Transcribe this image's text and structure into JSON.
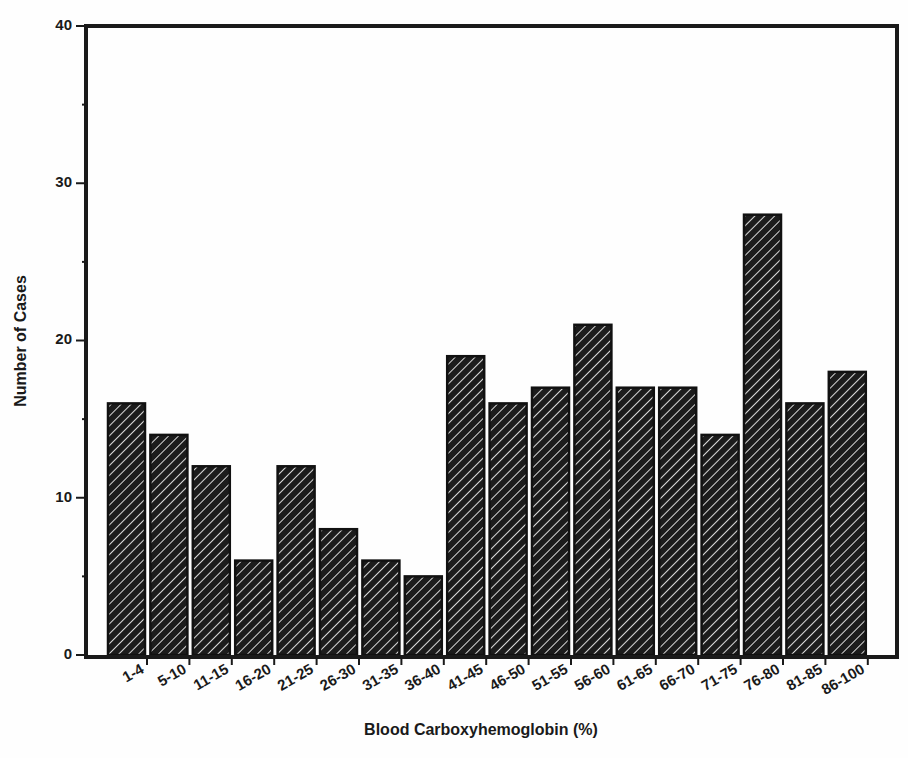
{
  "chart_data": {
    "type": "bar",
    "title": "",
    "xlabel": "Blood Carboxyhemoglobin (%)",
    "ylabel": "Number of Cases",
    "ylim": [
      0,
      40
    ],
    "yticks": [
      0,
      10,
      20,
      30,
      40
    ],
    "grid": false,
    "legend": null,
    "categories": [
      "1-4",
      "5-10",
      "11-15",
      "16-20",
      "21-25",
      "26-30",
      "31-35",
      "36-40",
      "41-45",
      "46-50",
      "51-55",
      "56-60",
      "61-65",
      "66-70",
      "71-75",
      "76-80",
      "81-85",
      "86-100"
    ],
    "values": [
      16,
      14,
      12,
      6,
      12,
      8,
      6,
      5,
      19,
      16,
      17,
      21,
      17,
      17,
      14,
      28,
      16,
      18
    ],
    "bar_style": "diagonal hatch, dark fill with light stripes"
  },
  "colors": {
    "bar_fill": "#1c1c1c",
    "hatch_stripe": "#d8d8d8",
    "axis": "#1a1a1a",
    "background": "#fefefe"
  }
}
